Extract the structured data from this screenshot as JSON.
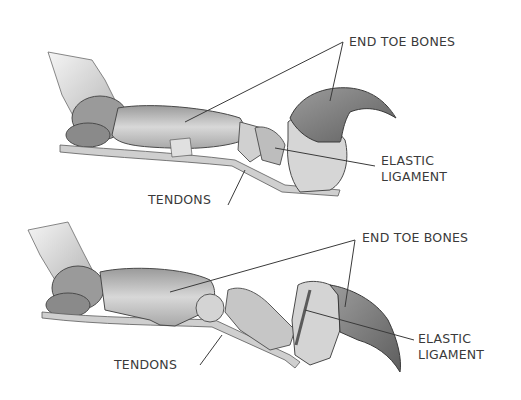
{
  "diagrams": [
    {
      "state": "retracted",
      "labels": {
        "end_toe_bones": "END TOE BONES",
        "elastic_ligament_line1": "ELASTIC",
        "elastic_ligament_line2": "LIGAMENT",
        "tendons": "TENDONS"
      }
    },
    {
      "state": "extended",
      "labels": {
        "end_toe_bones": "END TOE BONES",
        "elastic_ligament_line1": "ELASTIC",
        "elastic_ligament_line2": "LIGAMENT",
        "tendons": "TENDONS"
      }
    }
  ],
  "colors": {
    "background": "#ffffff",
    "ink": "#3a3a3a",
    "bone_light": "#d9d9d9",
    "bone_mid": "#b5b5b5",
    "bone_dark": "#8a8a8a",
    "claw": "#7a7a7a"
  }
}
